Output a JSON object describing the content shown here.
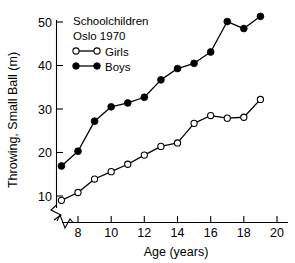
{
  "chart_data": {
    "type": "line",
    "title": "",
    "xlabel": "Age (years)",
    "ylabel": "Throwing, Small Ball (m)",
    "xlim": [
      6.6,
      20.2
    ],
    "ylim": [
      7.5,
      52.5
    ],
    "xticks": [
      "8",
      "10",
      "12",
      "14",
      "16",
      "18",
      "20"
    ],
    "xtick_values": [
      8,
      10,
      12,
      14,
      16,
      18,
      20
    ],
    "yticks": [
      "10",
      "20",
      "30",
      "40",
      "50"
    ],
    "ytick_values": [
      10,
      20,
      30,
      40,
      50
    ],
    "grid": false,
    "axis_break_x": true,
    "axis_break_y": true,
    "legend_position": "top-left",
    "annotations": [
      "Schoolchildren",
      "Oslo 1970"
    ],
    "x": [
      7,
      8,
      9,
      10,
      11,
      12,
      13,
      14,
      15,
      16,
      17,
      18,
      19
    ],
    "series": [
      {
        "name": "Girls",
        "marker": "open-circle",
        "color": "#000000",
        "values": [
          9.0,
          10.8,
          13.9,
          15.6,
          17.3,
          19.4,
          21.4,
          22.2,
          26.7,
          28.5,
          27.9,
          28.1,
          32.2
        ]
      },
      {
        "name": "Boys",
        "marker": "filled-circle",
        "color": "#000000",
        "values": [
          16.9,
          20.3,
          27.2,
          30.5,
          31.4,
          32.7,
          36.7,
          39.3,
          40.5,
          43.1,
          50.1,
          48.5,
          51.3
        ]
      }
    ]
  },
  "legend": {
    "line1": "Schoolchildren",
    "line2": "Oslo 1970",
    "entries": [
      {
        "label": "Girls",
        "marker": "open-circle"
      },
      {
        "label": "Boys",
        "marker": "filled-circle"
      }
    ]
  },
  "axes": {
    "x_title": "Age (years)",
    "y_title": "Throwing, Small Ball (m)"
  },
  "colors": {
    "ink": "#000000",
    "background": "#ffffff"
  }
}
